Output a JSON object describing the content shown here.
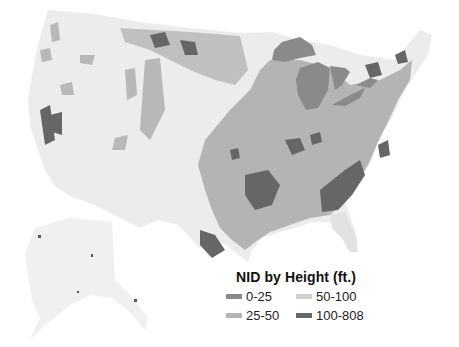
{
  "map": {
    "title": "NID by Height (ft.)",
    "type": "choropleth",
    "region": "United States (contiguous US + Alaska inset)",
    "base_color": "#ececec",
    "legend": {
      "title": "NID by Height (ft.)",
      "items": [
        {
          "label": "0-25",
          "color": "#8a8a8a"
        },
        {
          "label": "50-100",
          "color": "#d0d0d0"
        },
        {
          "label": "25-50",
          "color": "#b4b4b4"
        },
        {
          "label": "100-808",
          "color": "#666666"
        }
      ]
    },
    "lakes_color": "#8a8a8a"
  }
}
